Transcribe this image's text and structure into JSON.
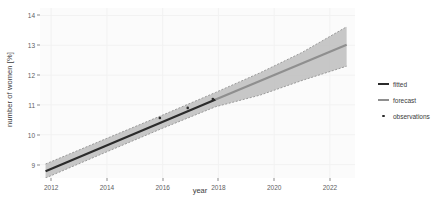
{
  "chart_data": {
    "type": "line",
    "title": "",
    "xlabel": "year",
    "ylabel": "number of women [%]",
    "xlim": [
      2011.6,
      2022.9
    ],
    "ylim": [
      8.55,
      14.25
    ],
    "xticks": [
      2012,
      2014,
      2016,
      2018,
      2020,
      2022
    ],
    "yticks": [
      9,
      10,
      11,
      12,
      13,
      14
    ],
    "grid": true,
    "legend_position": "right",
    "colors": {
      "fitted": "#2b2b2b",
      "forecast": "#8f8f8f",
      "observations": "#2b2b2b",
      "ribbon": "#b9b9b9",
      "panel_background": "#fbfbfb",
      "grid_line": "#f2f2f2"
    },
    "series": [
      {
        "name": "fitted",
        "type": "line",
        "x": [
          2011.8,
          2017.9
        ],
        "y": [
          8.78,
          11.18
        ]
      },
      {
        "name": "forecast",
        "type": "line",
        "x": [
          2017.9,
          2022.6
        ],
        "y": [
          11.18,
          13.02
        ]
      },
      {
        "name": "confidence band",
        "type": "ribbon",
        "x": [
          2011.8,
          2014.0,
          2016.0,
          2017.9,
          2019.5,
          2021.0,
          2022.6
        ],
        "lower": [
          8.55,
          9.43,
          10.22,
          10.94,
          11.33,
          11.82,
          12.3
        ],
        "upper": [
          9.02,
          9.88,
          10.66,
          11.42,
          12.08,
          12.76,
          13.62
        ]
      },
      {
        "name": "observations",
        "type": "scatter",
        "x": [
          2015.9,
          2016.9,
          2017.8
        ],
        "y": [
          10.56,
          10.9,
          11.2
        ]
      }
    ],
    "legend": [
      {
        "label": "fitted",
        "key": "line",
        "color": "#2b2b2b"
      },
      {
        "label": "forecast",
        "key": "line",
        "color": "#8f8f8f"
      },
      {
        "label": "observations",
        "key": "dot",
        "color": "#2b2b2b"
      }
    ]
  }
}
